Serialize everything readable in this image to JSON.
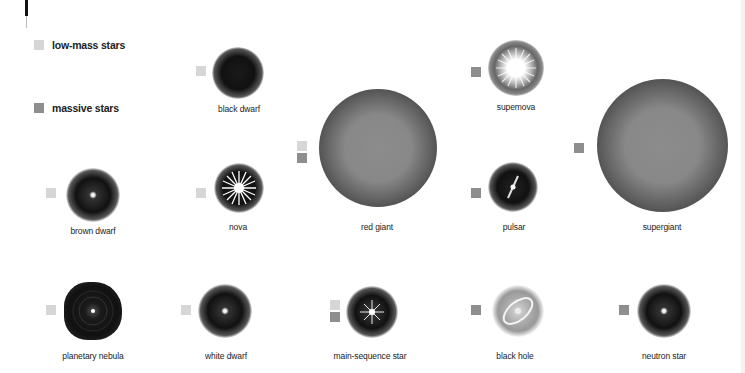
{
  "colors": {
    "low_mass": "#d6d6d6",
    "massive": "#8e8e8e"
  },
  "legend": {
    "items": [
      {
        "label": "low-mass stars",
        "color": "#d6d6d6"
      },
      {
        "label": "massive stars",
        "color": "#8e8e8e"
      }
    ]
  },
  "objects": {
    "black_dwarf": {
      "label": "black dwarf",
      "type": "low-mass"
    },
    "red_giant": {
      "label": "red giant",
      "type": "both"
    },
    "supernova": {
      "label": "supemova",
      "type": "massive"
    },
    "supergiant": {
      "label": "supergiant",
      "type": "massive"
    },
    "brown_dwarf": {
      "label": "brown dwarf",
      "type": "low-mass"
    },
    "nova": {
      "label": "nova",
      "type": "low-mass"
    },
    "pulsar": {
      "label": "pulsar",
      "type": "massive"
    },
    "planetary_nebula": {
      "label": "planetary nebula",
      "type": "low-mass"
    },
    "white_dwarf": {
      "label": "white dwarf",
      "type": "low-mass"
    },
    "main_sequence": {
      "label": "main-sequence star",
      "type": "both"
    },
    "black_hole": {
      "label": "black hole",
      "type": "massive"
    },
    "neutron_star": {
      "label": "neutron star",
      "type": "massive"
    }
  }
}
